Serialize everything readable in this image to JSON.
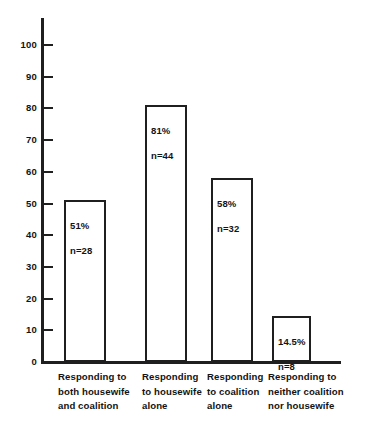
{
  "chart_data": {
    "type": "bar",
    "title": "",
    "subtitle": "",
    "xlabel": "",
    "ylabel": "",
    "ylim": [
      0,
      100
    ],
    "ytick_step": 10,
    "grid": false,
    "legend": "none",
    "categories": [
      "Responding to\nboth housewife\nand coalition",
      "Responding\nto housewife\nalone",
      "Responding\nto coalition\nalone",
      "Responding to\nneither coalition\nnor housewife"
    ],
    "values": [
      51,
      81,
      58,
      14.5
    ],
    "counts": [
      28,
      44,
      32,
      8
    ],
    "data_labels_pct": [
      "51%",
      "81%",
      "58%",
      "14.5%"
    ],
    "data_labels_n": [
      "n=28",
      "n=44",
      "n=32",
      "n=8"
    ],
    "ytick_labels": [
      "0",
      "10",
      "20",
      "30",
      "40",
      "50",
      "60",
      "70",
      "80",
      "90",
      "100"
    ],
    "colors": {
      "bar_fill": "#ffffff",
      "bar_stroke": "#1f1f1f",
      "axis": "#1f1f1f",
      "text": "#131313",
      "background": "#ffffff"
    }
  },
  "axis": {
    "y": {
      "ticks": [
        {
          "label": "100",
          "value": 100
        },
        {
          "label": "90",
          "value": 90
        },
        {
          "label": "80",
          "value": 80
        },
        {
          "label": "70",
          "value": 70
        },
        {
          "label": "60",
          "value": 60
        },
        {
          "label": "50",
          "value": 50
        },
        {
          "label": "40",
          "value": 40
        },
        {
          "label": "30",
          "value": 30
        },
        {
          "label": "20",
          "value": 20
        },
        {
          "label": "10",
          "value": 10
        },
        {
          "label": "0",
          "value": 0
        }
      ]
    }
  },
  "bars": [
    {
      "category": "Responding to\nboth housewife\nand coalition",
      "pct": "51%",
      "n": "n=28",
      "value": 51
    },
    {
      "category": "Responding\nto housewife\nalone",
      "pct": "81%",
      "n": "n=44",
      "value": 81
    },
    {
      "category": "Responding\nto coalition\nalone",
      "pct": "58%",
      "n": "n=32",
      "value": 58
    },
    {
      "category": "Responding to\nneither coalition\nnor housewife",
      "pct": "14.5%",
      "n": "n=8",
      "value": 14.5
    }
  ]
}
